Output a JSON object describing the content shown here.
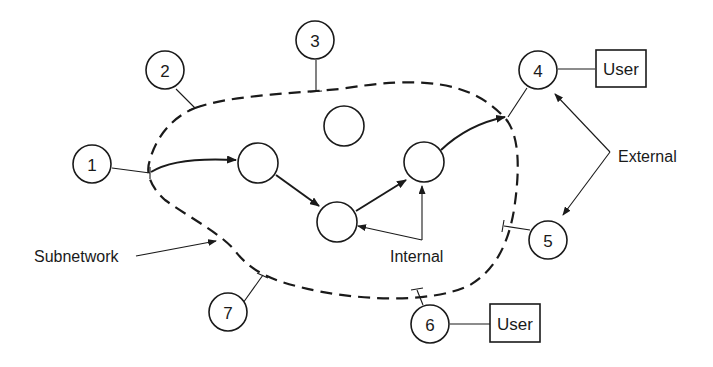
{
  "diagram": {
    "type": "network-subnetwork",
    "boundary_label": "Subnetwork",
    "external_nodes": [
      {
        "id": "1",
        "label": "1"
      },
      {
        "id": "2",
        "label": "2"
      },
      {
        "id": "3",
        "label": "3"
      },
      {
        "id": "4",
        "label": "4"
      },
      {
        "id": "5",
        "label": "5"
      },
      {
        "id": "6",
        "label": "6"
      },
      {
        "id": "7",
        "label": "7"
      }
    ],
    "internal_node_count": 5,
    "users": [
      {
        "attached_to": "4",
        "label": "User"
      },
      {
        "attached_to": "6",
        "label": "User"
      }
    ],
    "annotations": {
      "external": "External",
      "internal": "Internal",
      "subnetwork": "Subnetwork"
    },
    "edges": [
      {
        "from": "1",
        "to": "internal-a",
        "directed": true
      },
      {
        "from": "internal-a",
        "to": "internal-c",
        "directed": true
      },
      {
        "from": "internal-c",
        "to": "internal-d",
        "directed": true
      },
      {
        "from": "internal-d",
        "to": "4",
        "directed": true
      }
    ]
  }
}
